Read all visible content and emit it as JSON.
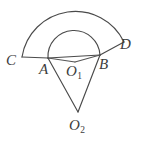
{
  "figure": {
    "background_color": "#ffffff",
    "stroke_color": "#4a4a4a",
    "label_color": "#3c3c3c",
    "width": 146,
    "height": 146,
    "labels": {
      "C": "C",
      "A": "A",
      "O1_letter": "O",
      "O1_sub": "1",
      "B": "B",
      "D": "D",
      "O2_letter": "O",
      "O2_sub": "2"
    },
    "points": {
      "C": {
        "x": 22,
        "y": 57
      },
      "A": {
        "x": 48,
        "y": 58
      },
      "O1": {
        "x": 75,
        "y": 62
      },
      "B": {
        "x": 100,
        "y": 55
      },
      "D": {
        "x": 124,
        "y": 42
      },
      "O2": {
        "x": 78,
        "y": 112
      }
    },
    "arcs": {
      "inner": {
        "name": "arc-A-B",
        "center": "O1",
        "radius": 26,
        "from": "A",
        "to": "B",
        "path": "M 48 58 A 26 26 0 0 1 100 55"
      },
      "outer": {
        "name": "arc-C-D",
        "center": "O1",
        "radius": 54,
        "from": "C",
        "to": "D",
        "path": "M 22 57 A 54 54 0 0 1 124 42"
      }
    },
    "segments": [
      {
        "name": "segment-C-A",
        "path": "M 22 57 L 48 58"
      },
      {
        "name": "segment-A-B",
        "path": "M 48 58 L 100 55"
      },
      {
        "name": "segment-B-D",
        "path": "M 100 55 L 124 42"
      },
      {
        "name": "segment-A-O1",
        "path": "M 48 58 L 75 62"
      },
      {
        "name": "segment-B-O1",
        "path": "M 100 55 L 75 62"
      },
      {
        "name": "segment-A-O2",
        "path": "M 48 58 L 78 112"
      },
      {
        "name": "segment-B-O2",
        "path": "M 100 55 L 78 112"
      }
    ]
  }
}
